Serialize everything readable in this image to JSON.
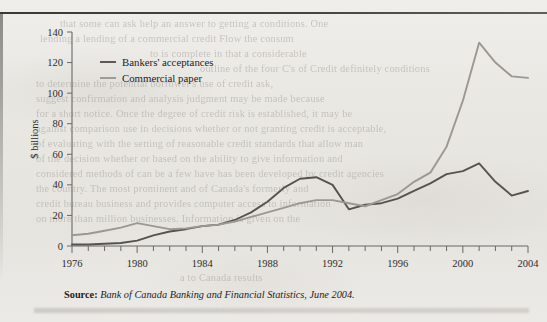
{
  "figure": {
    "y_axis_title": "$ billions",
    "source_prefix": "Source:",
    "source_text": "Bank of Canada Banking and Financial Statistics, June 2004."
  },
  "colors": {
    "bankers_acceptances": "#56534f",
    "commercial_paper": "#9b9792",
    "axis": "#6a6864",
    "page": "#e9e7e2"
  },
  "bleed_text": {
    "l1": "that some can ask help an answer to getting a  conditions. One",
    "l2": "lending  a lending  of a  commercial credit  Flow the consum",
    "l3": "to  is complete  in that a considerable",
    "l4": "outline  of the four C's of Credit  definitely conditions",
    "l5": "to  determine  the  potential  borrower's  use  of  credit  ask,",
    "l6": "suggest   confirmation   and   analysis   judgment   may   be   made   because",
    "l7": "for a short notice.  Once the degree of credit risk is established, it may be",
    "l8": "against comparison use in decisions whether or not granting credit is acceptable,",
    "l9": "of evaluating with the setting of reasonable credit standards that allow man",
    "l10": "of the decision whether or based on the ability to give information and",
    "l11": "considered methods of can be a few have has been developed by credit agencies",
    "l12": "the country. The most prominent  and  of  Canada's formerly  and",
    "l13": "credit bureau  business  and  provides  computer  access  to  information",
    "l14": "on more than  million businesses. Information is given on the",
    "l15": "a  to  Canada results"
  },
  "chart_data": {
    "type": "line",
    "title": "",
    "xlabel": "",
    "ylabel": "$ billions",
    "xlim": [
      1976,
      2004
    ],
    "ylim": [
      0,
      140
    ],
    "yticks": [
      0,
      20,
      40,
      60,
      80,
      100,
      120,
      140
    ],
    "xticks_labeled": [
      1976,
      1980,
      1984,
      1988,
      1992,
      1996,
      2000,
      2004
    ],
    "xticks_minor_step": 1,
    "grid": false,
    "legend_position": "upper-left-inside",
    "x": [
      1976,
      1977,
      1978,
      1979,
      1980,
      1981,
      1982,
      1983,
      1984,
      1985,
      1986,
      1987,
      1988,
      1989,
      1990,
      1991,
      1992,
      1993,
      1994,
      1995,
      1996,
      1997,
      1998,
      1999,
      2000,
      2001,
      2002,
      2003,
      2004
    ],
    "series": [
      {
        "name": "Bankers' acceptances",
        "color": "#56534f",
        "values": [
          1,
          1,
          1.5,
          2,
          3.5,
          7,
          9.5,
          11,
          13,
          14,
          17,
          22,
          29,
          38,
          44,
          45,
          40,
          24,
          27,
          28,
          31,
          36,
          41,
          47,
          49,
          54,
          42,
          33,
          36
        ]
      },
      {
        "name": "Commercial paper",
        "color": "#9b9792",
        "values": [
          7,
          8,
          10,
          12,
          15,
          13,
          11,
          11.5,
          13,
          14,
          16,
          19,
          22,
          25,
          28,
          30,
          30,
          28,
          26,
          30,
          34,
          42,
          48,
          65,
          95,
          133,
          120,
          111,
          110
        ]
      }
    ]
  }
}
